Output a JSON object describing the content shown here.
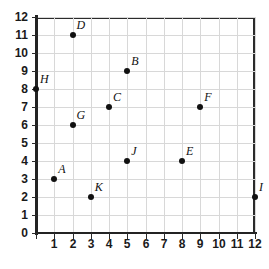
{
  "chart_data": {
    "type": "scatter",
    "title": "",
    "xlabel": "",
    "ylabel": "",
    "xlim": [
      0,
      12
    ],
    "ylim": [
      0,
      12
    ],
    "grid": true,
    "legend": "none",
    "x_ticks": [
      "0",
      "1",
      "2",
      "3",
      "4",
      "5",
      "6",
      "7",
      "8",
      "9",
      "10",
      "11",
      "12"
    ],
    "y_ticks": [
      "0",
      "1",
      "2",
      "3",
      "4",
      "5",
      "6",
      "7",
      "8",
      "9",
      "10",
      "11",
      "12"
    ],
    "points": [
      {
        "label": "A",
        "x": 1,
        "y": 3
      },
      {
        "label": "B",
        "x": 5,
        "y": 9
      },
      {
        "label": "C",
        "x": 4,
        "y": 7
      },
      {
        "label": "D",
        "x": 2,
        "y": 11
      },
      {
        "label": "E",
        "x": 8,
        "y": 4
      },
      {
        "label": "F",
        "x": 9,
        "y": 7
      },
      {
        "label": "G",
        "x": 2,
        "y": 6
      },
      {
        "label": "H",
        "x": 0,
        "y": 8
      },
      {
        "label": "I",
        "x": 12,
        "y": 2
      },
      {
        "label": "J",
        "x": 5,
        "y": 4
      },
      {
        "label": "K",
        "x": 3,
        "y": 2
      }
    ]
  },
  "colors": {
    "point": "#111111",
    "grid": "#d8d8d8",
    "axis": "#232323",
    "background": "#ffffff"
  }
}
